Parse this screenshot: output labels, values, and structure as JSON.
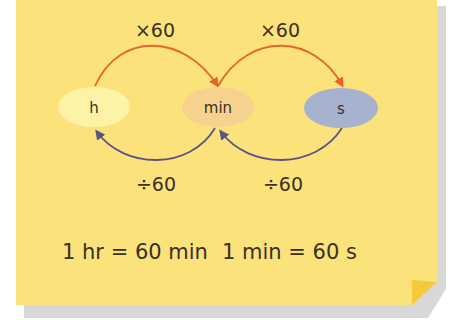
{
  "diagram": {
    "nodes": [
      {
        "id": "h",
        "label": "h",
        "color": "#fdf3a6"
      },
      {
        "id": "min",
        "label": "min",
        "color": "#f7d28f"
      },
      {
        "id": "s",
        "label": "s",
        "color": "#a7b2cf"
      }
    ],
    "forward_arrows": [
      {
        "from": "h",
        "to": "min",
        "label": "×60",
        "color": "#e8622a"
      },
      {
        "from": "min",
        "to": "s",
        "label": "×60",
        "color": "#e8622a"
      }
    ],
    "backward_arrows": [
      {
        "from": "min",
        "to": "h",
        "label": "÷60",
        "color": "#5a5488"
      },
      {
        "from": "s",
        "to": "min",
        "label": "÷60",
        "color": "#5a5488"
      }
    ],
    "equations": [
      "1 hr = 60 min",
      "1 min = 60 s"
    ],
    "colors": {
      "card": "#fbe27a",
      "shadow": "#d9d9d9",
      "fold": "#f7c93c",
      "text": "#3a3026"
    }
  }
}
